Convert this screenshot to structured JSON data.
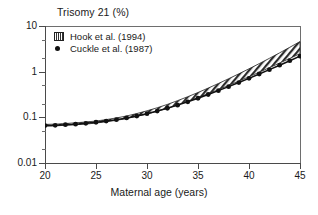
{
  "chart_data": {
    "type": "line",
    "title": "Trisomy 21 (%)",
    "xlabel": "Maternal age (years)",
    "ylabel": "Trisomy 21 (%)",
    "yscale": "log",
    "ylim": [
      0.01,
      10
    ],
    "xlim": [
      20,
      45
    ],
    "grid": false,
    "legend_position": "top-left",
    "xticks": [
      "20",
      "25",
      "30",
      "35",
      "40",
      "45"
    ],
    "xtick_values": [
      20,
      25,
      30,
      35,
      40,
      45
    ],
    "yticks": [
      "10",
      "1",
      "0.1",
      "0.01"
    ],
    "ytick_values": [
      10,
      1,
      0.1,
      0.01
    ],
    "x": [
      20,
      21,
      22,
      23,
      24,
      25,
      26,
      27,
      28,
      29,
      30,
      31,
      32,
      33,
      34,
      35,
      36,
      37,
      38,
      39,
      40,
      41,
      42,
      43,
      44,
      45
    ],
    "series": [
      {
        "name": "Hook et al. (1994)",
        "style": "hatched-band",
        "values": [
          0.067,
          0.068,
          0.07,
          0.072,
          0.075,
          0.079,
          0.084,
          0.091,
          0.1,
          0.112,
          0.127,
          0.147,
          0.173,
          0.207,
          0.25,
          0.305,
          0.376,
          0.468,
          0.587,
          0.741,
          0.94,
          1.2,
          1.54,
          1.99,
          2.58,
          3.36
        ],
        "band_upper": [
          0.07,
          0.071,
          0.073,
          0.076,
          0.079,
          0.083,
          0.089,
          0.097,
          0.107,
          0.121,
          0.139,
          0.162,
          0.192,
          0.232,
          0.283,
          0.35,
          0.437,
          0.551,
          0.7,
          0.896,
          1.155,
          1.5,
          1.96,
          2.58,
          3.42,
          4.56
        ],
        "band_lower": [
          0.064,
          0.065,
          0.067,
          0.069,
          0.071,
          0.075,
          0.08,
          0.086,
          0.094,
          0.105,
          0.118,
          0.136,
          0.158,
          0.188,
          0.224,
          0.27,
          0.329,
          0.404,
          0.499,
          0.62,
          0.774,
          0.97,
          1.22,
          1.54,
          1.95,
          2.48
        ]
      },
      {
        "name": "Cuckle et al. (1987)",
        "style": "line-with-filled-circles",
        "values": [
          0.066,
          0.067,
          0.069,
          0.071,
          0.074,
          0.078,
          0.083,
          0.089,
          0.097,
          0.107,
          0.12,
          0.137,
          0.158,
          0.185,
          0.219,
          0.262,
          0.316,
          0.384,
          0.47,
          0.578,
          0.715,
          0.888,
          1.107,
          1.385,
          1.737,
          2.185
        ]
      }
    ]
  },
  "figure": {
    "title": "Trisomy 21 (%)",
    "xaxis_title": "Maternal age (years)",
    "legend": [
      {
        "label": "Hook et al. (1994)",
        "symbol": "hatched-square-swatch"
      },
      {
        "label": "Cuckle et al. (1987)",
        "symbol": "filled-circle-marker"
      }
    ],
    "colors": {
      "axis": "#4a4a4a",
      "marker": "#111111",
      "band_stroke": "#222222",
      "text": "#1a1a1a",
      "background": "#ffffff"
    }
  }
}
